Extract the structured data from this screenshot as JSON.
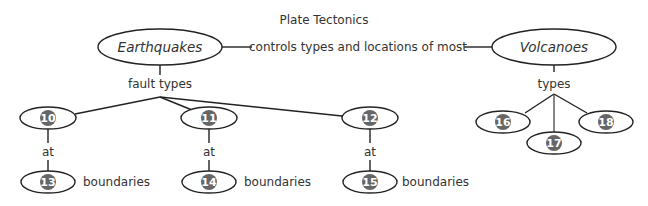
{
  "title": "Plate Tectonics",
  "main_nodes": {
    "earthquakes": "Earthquakes",
    "volcanoes": "Volcanoes"
  },
  "link_labels": {
    "main_link": "controls types and locations of most",
    "fault_types": "fault types",
    "volcano_types": "types",
    "at": "at",
    "boundaries": "boundaries"
  },
  "blanks": {
    "fault_1": "10",
    "fault_2": "11",
    "fault_3": "12",
    "boundary_1": "13",
    "boundary_2": "14",
    "boundary_3": "15",
    "volcano_1": "16",
    "volcano_2": "17",
    "volcano_3": "18"
  },
  "colors": {
    "badge": "#666666",
    "line": "#222222",
    "text": "#333333"
  }
}
